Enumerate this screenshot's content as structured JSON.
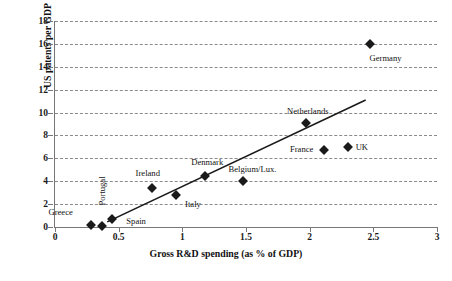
{
  "chart_data": {
    "type": "scatter",
    "title": "",
    "xlabel": "Gross R&D spending (as % of GDP)",
    "ylabel": "US patents per GDP",
    "xlim": [
      0,
      3
    ],
    "ylim": [
      0,
      18
    ],
    "xticks": [
      "0",
      "0.5",
      "1",
      "1.5",
      "2",
      "2.5",
      "3"
    ],
    "xtick_values": [
      0,
      0.5,
      1,
      1.5,
      2,
      2.5,
      3
    ],
    "yticks": [
      "0",
      "2",
      "4",
      "6",
      "8",
      "10",
      "12",
      "14",
      "16",
      "18"
    ],
    "ytick_values": [
      0,
      2,
      4,
      6,
      8,
      10,
      12,
      14,
      16,
      18
    ],
    "grid": "horizontal-dashed",
    "legend": "none",
    "points": [
      {
        "label": "Greece",
        "x": 0.28,
        "y": 0.2,
        "label_dx": -30,
        "label_dy": -13,
        "rotated": false
      },
      {
        "label": "Spain",
        "x": 0.37,
        "y": 0.05,
        "label_dx": 34,
        "label_dy": -5,
        "rotated": false
      },
      {
        "label": "Portugal",
        "x": 0.45,
        "y": 0.7,
        "label_dx": -10,
        "label_dy": -28,
        "rotated": true
      },
      {
        "label": "Ireland",
        "x": 0.76,
        "y": 3.4,
        "label_dx": -4,
        "label_dy": -15,
        "rotated": false
      },
      {
        "label": "Italy",
        "x": 0.95,
        "y": 2.8,
        "label_dx": 17,
        "label_dy": 9,
        "rotated": false
      },
      {
        "label": "Denmark",
        "x": 1.18,
        "y": 4.5,
        "label_dx": 2,
        "label_dy": -14,
        "rotated": false
      },
      {
        "label": "Belgium/Lux.",
        "x": 1.48,
        "y": 4.0,
        "label_dx": 9,
        "label_dy": -12,
        "rotated": false
      },
      {
        "label": "Netherlands",
        "x": 1.97,
        "y": 9.1,
        "label_dx": 2,
        "label_dy": -12,
        "rotated": false
      },
      {
        "label": "France",
        "x": 2.11,
        "y": 6.7,
        "label_dx": -22,
        "label_dy": -1,
        "rotated": false
      },
      {
        "label": "UK",
        "x": 2.3,
        "y": 7.0,
        "label_dx": 14,
        "label_dy": 0,
        "rotated": false
      },
      {
        "label": "Germany",
        "x": 2.47,
        "y": 16.0,
        "label_dx": 16,
        "label_dy": 14,
        "rotated": false
      }
    ],
    "trendline": {
      "label": "linear fit",
      "x0": 0.41,
      "y0": 0.45,
      "x1": 2.44,
      "y1": 11.1
    }
  }
}
